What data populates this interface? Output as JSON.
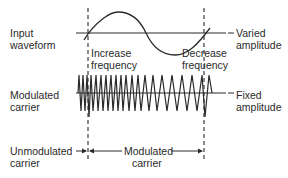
{
  "diagram": {
    "colors": {
      "ink": "#2a2a2a",
      "background": "#ffffff"
    },
    "labels": {
      "input_line1": "Input",
      "input_line2": "waveform",
      "varied_line1": "Varied",
      "varied_line2": "amplitude",
      "increase_line1": "Increase",
      "increase_line2": "frequency",
      "decrease_line1": "Decrease",
      "decrease_line2": "frequency",
      "modcarrier_line1": "Modulated",
      "modcarrier_line2": "carrier",
      "fixed_line1": "Fixed",
      "fixed_line2": "amplitude",
      "unmod_line1": "Unmodulated",
      "unmod_line2": "carrier",
      "modspan_line1": "Modulated",
      "modspan_line2": "carrier"
    }
  }
}
